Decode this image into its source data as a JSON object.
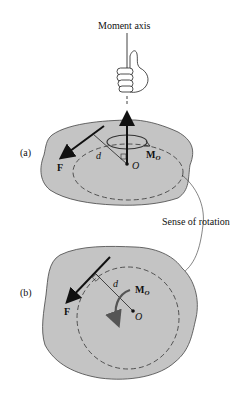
{
  "labels": {
    "moment_axis": "Moment axis",
    "sense_of_rotation": "Sense of rotation",
    "panel_a": "(a)",
    "panel_b": "(b)",
    "force": "F",
    "distance": "d",
    "moment_M": "M",
    "moment_sub": "O",
    "point_O": "O"
  },
  "colors": {
    "plate_fill": "#c4c4c4",
    "plate_stroke": "#444444",
    "line": "#111111",
    "rotation_arrow": "#555555"
  }
}
